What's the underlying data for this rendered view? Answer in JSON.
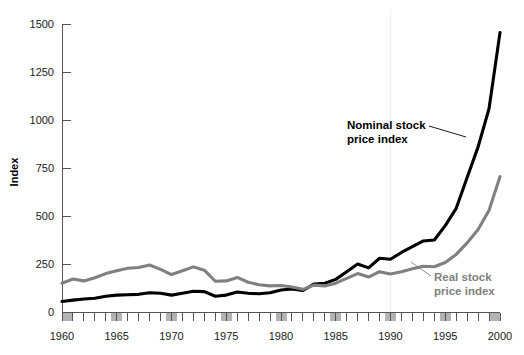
{
  "chart_data": {
    "type": "line",
    "title": "",
    "xlabel": "",
    "ylabel": "Index",
    "ylim": [
      0,
      1500
    ],
    "xlim": [
      1960,
      2000
    ],
    "yticks": [
      0,
      250,
      500,
      750,
      1000,
      1250,
      1500
    ],
    "ytick_labels": [
      "0",
      "250",
      "500",
      "750",
      "1000",
      "1250",
      "1500"
    ],
    "xticks": [
      1960,
      1965,
      1970,
      1975,
      1980,
      1985,
      1990,
      1995,
      2000
    ],
    "xtick_labels": [
      "1960",
      "1965",
      "1970",
      "1975",
      "1980",
      "1985",
      "1990",
      "1995",
      "2000"
    ],
    "minor_xtick_interval": 1,
    "grid": "single faint vertical line at 1990",
    "gridlines_x": [
      1990
    ],
    "axis_bands": {
      "description": "gray shaded blocks on the x-axis at each labeled 5-year tick",
      "years": [
        1960,
        1965,
        1970,
        1975,
        1980,
        1985,
        1990,
        1995,
        2000
      ],
      "color": "#b3b3b3"
    },
    "legend_position": "inline annotations",
    "x": [
      1960,
      1961,
      1962,
      1963,
      1964,
      1965,
      1966,
      1967,
      1968,
      1969,
      1970,
      1971,
      1972,
      1973,
      1974,
      1975,
      1976,
      1977,
      1978,
      1979,
      1980,
      1981,
      1982,
      1983,
      1984,
      1985,
      1986,
      1987,
      1988,
      1989,
      1990,
      1991,
      1992,
      1993,
      1994,
      1995,
      1996,
      1997,
      1998,
      1999,
      2000
    ],
    "series": [
      {
        "name": "Nominal stock price index",
        "color": "#000000",
        "label_lines": [
          "Nominal stock",
          "price index"
        ],
        "values": [
          55,
          62,
          68,
          72,
          82,
          88,
          90,
          92,
          100,
          98,
          88,
          98,
          108,
          106,
          82,
          88,
          104,
          98,
          95,
          100,
          115,
          120,
          112,
          145,
          150,
          170,
          210,
          250,
          230,
          280,
          275,
          310,
          340,
          370,
          375,
          450,
          540,
          700,
          860,
          1060,
          1455
        ]
      },
      {
        "name": "Real stock price index",
        "color": "#808080",
        "label_lines": [
          "Real stock",
          "price index"
        ],
        "values": [
          150,
          172,
          162,
          178,
          200,
          215,
          228,
          232,
          245,
          222,
          195,
          215,
          235,
          218,
          160,
          162,
          180,
          155,
          142,
          136,
          138,
          130,
          118,
          140,
          136,
          150,
          175,
          200,
          182,
          210,
          198,
          210,
          225,
          238,
          236,
          258,
          300,
          360,
          430,
          530,
          705
        ]
      }
    ],
    "annotations": [
      {
        "id": "nominal-annotation",
        "text_lines": [
          "Nominal stock",
          "price index"
        ],
        "color": "#000000",
        "x_px": 347,
        "y_px": 129,
        "leader": "from text right edge to the black curve near 1996"
      },
      {
        "id": "real-annotation",
        "text_lines": [
          "Real stock",
          "price index"
        ],
        "color": "#808080",
        "x_px": 434,
        "y_px": 281,
        "leader": "from text up-left to the gray curve near 1994"
      }
    ]
  },
  "axis": {
    "y_title": "Index"
  }
}
